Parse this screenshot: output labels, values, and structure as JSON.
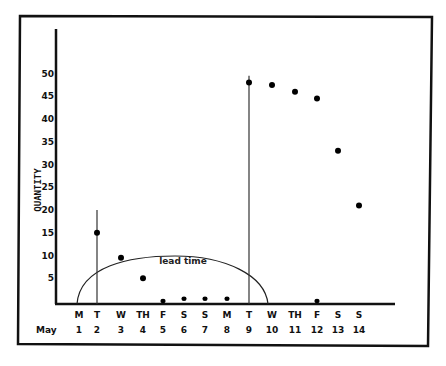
{
  "chart_data": {
    "type": "scatter",
    "title": "",
    "xlabel": "",
    "ylabel": "QUANTITY",
    "month_label": "May",
    "ylim": [
      0,
      55
    ],
    "yticks": [
      5,
      10,
      15,
      20,
      25,
      30,
      35,
      40,
      45,
      50
    ],
    "grid": false,
    "legend": null,
    "categories": [
      {
        "day": "M",
        "date": "1"
      },
      {
        "day": "T",
        "date": "2"
      },
      {
        "day": "W",
        "date": "3"
      },
      {
        "day": "TH",
        "date": "4"
      },
      {
        "day": "F",
        "date": "5"
      },
      {
        "day": "S",
        "date": "6"
      },
      {
        "day": "S",
        "date": "7"
      },
      {
        "day": "M",
        "date": "8"
      },
      {
        "day": "T",
        "date": "9"
      },
      {
        "day": "W",
        "date": "10"
      },
      {
        "day": "TH",
        "date": "11"
      },
      {
        "day": "F",
        "date": "12"
      },
      {
        "day": "S",
        "date": "13"
      },
      {
        "day": "S",
        "date": "14"
      }
    ],
    "series": [
      {
        "name": "quantity",
        "points": [
          {
            "date": "2",
            "value": 15
          },
          {
            "date": "3",
            "value": 9.5
          },
          {
            "date": "4",
            "value": 5
          },
          {
            "date": "5",
            "value": 0
          },
          {
            "date": "6",
            "value": 0.5
          },
          {
            "date": "7",
            "value": 0.5
          },
          {
            "date": "8",
            "value": 0.5
          },
          {
            "date": "9",
            "value": 48
          },
          {
            "date": "10",
            "value": 47.5
          },
          {
            "date": "11",
            "value": 46
          },
          {
            "date": "12",
            "value": 44.5
          },
          {
            "date": "12",
            "value": 0
          },
          {
            "date": "13",
            "value": 33
          },
          {
            "date": "14",
            "value": 21
          }
        ]
      }
    ],
    "vertical_lines": [
      {
        "date": "2",
        "top": 20
      },
      {
        "date": "9",
        "top": 49.5
      }
    ],
    "annotations": [
      {
        "text": "lead time",
        "shape": "half-ellipse",
        "from_date": "1",
        "to_date": "9.9",
        "peak": 10
      }
    ]
  }
}
